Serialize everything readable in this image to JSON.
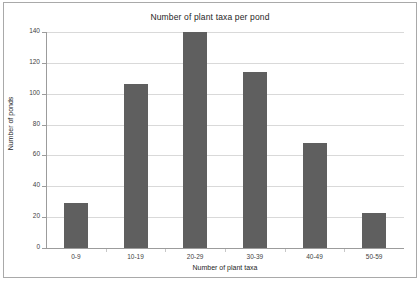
{
  "chart_data": {
    "type": "bar",
    "title": "Number of plant taxa per pond",
    "xlabel": "Number of plant taxa",
    "ylabel": "Number of ponds",
    "categories": [
      "0-9",
      "10-19",
      "20-29",
      "30-39",
      "40-49",
      "50-59"
    ],
    "values": [
      29,
      106,
      140,
      114,
      68,
      23
    ],
    "ylim": [
      0,
      140
    ],
    "yticks": [
      0,
      20,
      40,
      60,
      80,
      100,
      120,
      140
    ],
    "ytick_labels": [
      "0",
      "20",
      "40",
      "60",
      "80",
      "100",
      "120",
      "140"
    ],
    "grid": true,
    "legend": false,
    "bar_color": "#5f5f5f",
    "gridline_color": "#d9d9d9",
    "axis_color": "#9c9c9c",
    "frame_color": "#a9a9a9",
    "background_color": "#ffffff",
    "text_color": "#262626"
  }
}
